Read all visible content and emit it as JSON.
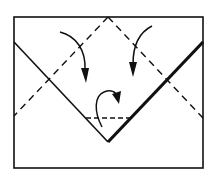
{
  "diagram": {
    "type": "origami-fold-step",
    "colors": {
      "ink": "#111111",
      "paper": "#ffffff"
    },
    "paper_rect": {
      "x": 14,
      "y": 17,
      "width": 189,
      "height": 151
    },
    "dashed_lines": [
      {
        "name": "left-diagonal-fold",
        "x1": 108,
        "y1": 17,
        "x2": 14,
        "y2": 116
      },
      {
        "name": "right-diagonal-fold",
        "x1": 108,
        "y1": 17,
        "x2": 203,
        "y2": 118
      },
      {
        "name": "bottom-horizontal-fold",
        "x1": 86,
        "y1": 118,
        "x2": 132,
        "y2": 118
      }
    ],
    "solid_lines": [
      {
        "name": "left-edge-v",
        "x1": 14,
        "y1": 42,
        "x2": 108,
        "y2": 142,
        "width": 1.6
      },
      {
        "name": "right-edge-v-thick",
        "x1": 203,
        "y1": 42,
        "x2": 108,
        "y2": 142,
        "width": 3.2
      }
    ],
    "arrows": [
      {
        "name": "left-fold-arrow",
        "direction": "down-right-curve"
      },
      {
        "name": "right-fold-arrow",
        "direction": "down-left-curve"
      },
      {
        "name": "bottom-flip-arrow",
        "direction": "loop-over"
      }
    ]
  }
}
